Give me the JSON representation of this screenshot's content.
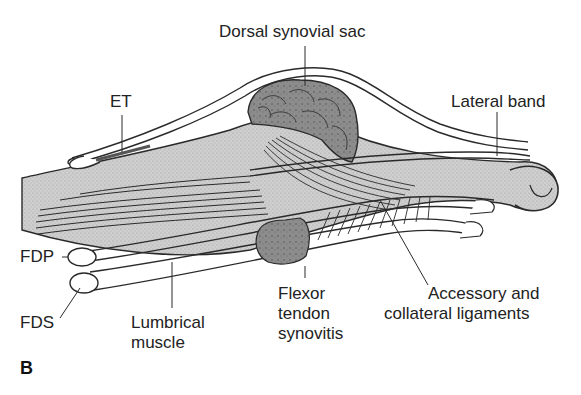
{
  "figure": {
    "panel_letter": "B",
    "colors": {
      "background": "#ffffff",
      "outline": "#2a2a2a",
      "tissue_fill": "#c9c9c9",
      "synovium_fill": "#8f8f8f",
      "tendon_fill": "#ffffff",
      "text": "#222222"
    }
  },
  "labels": {
    "dorsal_synovial_sac": "Dorsal synovial sac",
    "et": "ET",
    "lateral_band": "Lateral band",
    "fdp": "FDP",
    "fds": "FDS",
    "lumbrical": [
      "Lumbrical",
      "muscle"
    ],
    "flexor": [
      "Flexor",
      "tendon",
      "synovitis"
    ],
    "accessory": [
      "Accessory and",
      "collateral ligaments"
    ]
  }
}
